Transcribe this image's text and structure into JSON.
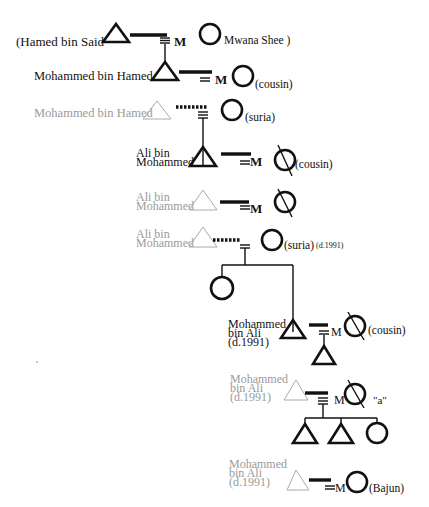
{
  "diagram": {
    "type": "kinship-genealogy",
    "generations": [
      {
        "id": "g1",
        "male": {
          "label": "(Hamed bin Said",
          "style": "bold"
        },
        "union": {
          "marker": "M",
          "line": "solid"
        },
        "female": {
          "label": "Mwana Shee )",
          "style": "bold",
          "deceased": false
        }
      },
      {
        "id": "g2a",
        "male": {
          "label": "Mohammed bin Hamed",
          "style": "bold"
        },
        "union": {
          "marker": "M",
          "line": "solid"
        },
        "female": {
          "label": "(cousin)",
          "style": "bold",
          "deceased": false
        }
      },
      {
        "id": "g2b",
        "male": {
          "label": "Mohammed bin Hamed",
          "style": "grey"
        },
        "union": {
          "marker": "",
          "line": "dashed"
        },
        "female": {
          "label": "(suria)",
          "style": "bold",
          "deceased": false
        }
      },
      {
        "id": "g3a",
        "male": {
          "label_line1": "Ali bin",
          "label_line2": "Mohammed",
          "style": "bold"
        },
        "union": {
          "marker": "M",
          "line": "solid"
        },
        "female": {
          "label": "(cousin)",
          "style": "bold",
          "deceased": true
        }
      },
      {
        "id": "g3b",
        "male": {
          "label_line1": "Ali bin",
          "label_line2": "Mohammed",
          "style": "grey"
        },
        "union": {
          "marker": "M",
          "line": "solid"
        },
        "female": {
          "label": "",
          "style": "bold",
          "deceased": true
        }
      },
      {
        "id": "g3c",
        "male": {
          "label_line1": "Ali bin",
          "label_line2": "Mohammed",
          "style": "grey"
        },
        "union": {
          "marker": "",
          "line": "dashed"
        },
        "female": {
          "label": "(suria)",
          "note": "(d.1991)",
          "style": "bold",
          "deceased": false
        },
        "children": [
          "female",
          "male (Mohammed bin Ali)"
        ]
      },
      {
        "id": "g4a",
        "male": {
          "label_line1": "Mohammed",
          "label_line2": "bin Ali",
          "label_line3": "(d.1991)",
          "style": "bold"
        },
        "union": {
          "marker": "M",
          "line": "solid"
        },
        "female": {
          "label": "(cousin)",
          "style": "bold",
          "deceased": true
        },
        "children": [
          "male"
        ]
      },
      {
        "id": "g4b",
        "male": {
          "label_line1": "Mohammed",
          "label_line2": "bin Ali",
          "label_line3": "(d.1991)",
          "style": "grey"
        },
        "union": {
          "marker": "M",
          "line": "solid"
        },
        "female": {
          "label": "\"a\"",
          "style": "bold",
          "deceased": true
        },
        "children": [
          "male",
          "male",
          "female"
        ]
      },
      {
        "id": "g4c",
        "male": {
          "label_line1": "Mohammed",
          "label_line2": "bin Ali",
          "label_line3": "(d.1991)",
          "style": "grey"
        },
        "union": {
          "marker": "M",
          "line": "solid"
        },
        "female": {
          "label": "(Bajun)",
          "style": "bold",
          "deceased": false
        }
      }
    ]
  }
}
